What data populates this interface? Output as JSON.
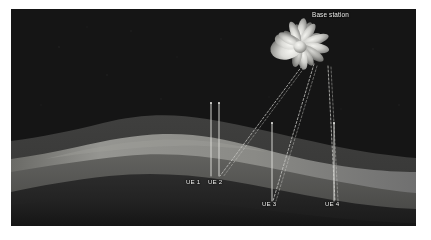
{
  "figure": {
    "kind": "illustration",
    "background_color": "#ffffff",
    "scene_color": "#141414"
  },
  "scene": {
    "terrain": {
      "layers": [
        {
          "name": "far-ridge",
          "color": "#3d3d3d"
        },
        {
          "name": "mid-valley-bright",
          "color": "#888884"
        },
        {
          "name": "mid-slope",
          "color": "#5a5a58"
        },
        {
          "name": "near-ridge-dark",
          "color": "#2a2a2a"
        },
        {
          "name": "foreground-shadow",
          "color": "#1d1d1d"
        }
      ]
    }
  },
  "base_station": {
    "label": "Base station",
    "label_x": 312,
    "label_y": 11,
    "antenna_center_x": 300,
    "antenna_center_y": 45,
    "lobe_color_bright": "#e8e8e4",
    "lobe_color_mid": "#b4b4b0",
    "lobe_color_dark": "#6e6e6c",
    "lobes": [
      {
        "name": "main-lobe-left",
        "angle": 196,
        "length": 30,
        "width": 21
      },
      {
        "name": "side-lobe-a",
        "angle": 165,
        "length": 26,
        "width": 11
      },
      {
        "name": "side-lobe-b",
        "angle": 140,
        "length": 24,
        "width": 10
      },
      {
        "name": "side-lobe-c",
        "angle": 118,
        "length": 22,
        "width": 9
      },
      {
        "name": "side-lobe-d",
        "angle": 95,
        "length": 25,
        "width": 9
      },
      {
        "name": "side-lobe-e",
        "angle": 72,
        "length": 26,
        "width": 9
      },
      {
        "name": "side-lobe-f",
        "angle": 48,
        "length": 27,
        "width": 10
      },
      {
        "name": "side-lobe-g",
        "angle": 22,
        "length": 24,
        "width": 9
      },
      {
        "name": "side-lobe-h",
        "angle": 350,
        "length": 22,
        "width": 8
      },
      {
        "name": "side-lobe-i",
        "angle": 300,
        "length": 20,
        "width": 8
      },
      {
        "name": "side-lobe-j",
        "angle": 262,
        "length": 18,
        "width": 8
      },
      {
        "name": "side-lobe-k",
        "angle": 228,
        "length": 19,
        "width": 9
      }
    ]
  },
  "user_equipment": [
    {
      "id": "ue-1",
      "label": "UE 1",
      "label_x": 186,
      "label_y": 178,
      "pole_x": 211,
      "pole_top_y": 103,
      "pole_bottom_y": 176,
      "has_beam": false
    },
    {
      "id": "ue-2",
      "label": "UE 2",
      "label_x": 208,
      "label_y": 178,
      "pole_x": 219,
      "pole_top_y": 103,
      "pole_bottom_y": 176,
      "has_beam": true
    },
    {
      "id": "ue-3",
      "label": "UE 3",
      "label_x": 262,
      "label_y": 200,
      "pole_x": 272,
      "pole_top_y": 123,
      "pole_bottom_y": 201,
      "has_beam": true
    },
    {
      "id": "ue-4",
      "label": "UE 4",
      "label_x": 325,
      "label_y": 200,
      "pole_x": 334,
      "pole_top_y": 123,
      "pole_bottom_y": 201,
      "has_beam": true
    }
  ],
  "beams": [
    {
      "name": "beam-to-ue-2",
      "from_x": 290,
      "from_y": 58,
      "to_x": 220,
      "to_y": 176,
      "style": "dashed"
    },
    {
      "name": "beam-to-ue-3",
      "from_x": 303,
      "from_y": 56,
      "to_x": 273,
      "to_y": 200,
      "style": "dashed"
    },
    {
      "name": "beam-to-ue-4",
      "from_x": 318,
      "from_y": 58,
      "to_x": 335,
      "to_y": 200,
      "style": "dashed"
    }
  ],
  "colors": {
    "pole": "#d8d8d4",
    "beam_dash": "#c8c8c4",
    "label_text": "#f0f0ee"
  }
}
